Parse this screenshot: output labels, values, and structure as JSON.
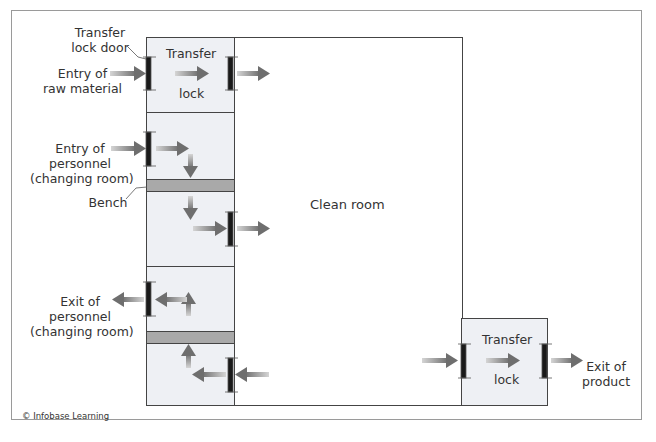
{
  "diagram": {
    "labels": {
      "transfer_lock_door": [
        "Transfer",
        "lock door"
      ],
      "entry_raw_material": [
        "Entry of",
        "raw material"
      ],
      "entry_personnel": [
        "Entry of",
        "personnel",
        "(changing room)"
      ],
      "bench": "Bench",
      "exit_personnel": [
        "Exit of",
        "personnel",
        "(changing room)"
      ],
      "clean_room": "Clean room",
      "exit_product": [
        "Exit of",
        "product"
      ]
    },
    "rooms": {
      "transfer_lock_top": {
        "line1": "Transfer",
        "line2": "lock"
      },
      "transfer_lock_bottom": {
        "line1": "Transfer",
        "line2": "lock"
      }
    },
    "credit": "© Infobase Learning",
    "colors": {
      "room_fill": "#eef0f4",
      "bench_fill": "#a9a9a9",
      "door": "#1a1a1a",
      "arrow": "#7a7a7a",
      "outline": "#444444"
    }
  }
}
